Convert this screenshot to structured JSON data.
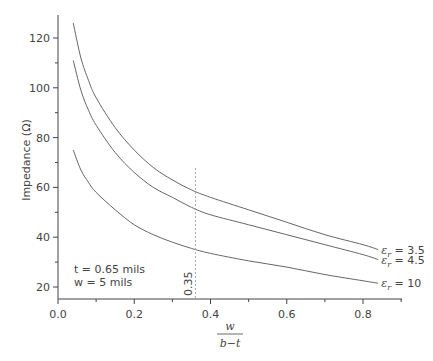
{
  "chart_data": {
    "type": "line",
    "title": "",
    "xlabel_numerator": "w",
    "xlabel_denominator": "b−t",
    "ylabel": "Impedance (Ω)",
    "xlim": [
      0.0,
      0.9
    ],
    "ylim": [
      15,
      130
    ],
    "x_ticks": [
      "0.0",
      "0.2",
      "0.4",
      "0.6",
      "0.8"
    ],
    "y_ticks": [
      "20",
      "40",
      "60",
      "80",
      "100",
      "120"
    ],
    "grid": false,
    "series": [
      {
        "name": "εr = 3.5",
        "label_prefix": "ε",
        "label_sub": "r",
        "label_value": " = 3.5",
        "x": [
          0.04,
          0.06,
          0.08,
          0.1,
          0.15,
          0.2,
          0.25,
          0.3,
          0.35,
          0.4,
          0.5,
          0.6,
          0.7,
          0.8,
          0.84
        ],
        "y": [
          126,
          112,
          103,
          96,
          84,
          75,
          68,
          63,
          59,
          56,
          51,
          46,
          41,
          37,
          35
        ]
      },
      {
        "name": "εr = 4.5",
        "label_prefix": "ε",
        "label_sub": "r",
        "label_value": " = 4.5",
        "x": [
          0.04,
          0.06,
          0.08,
          0.1,
          0.15,
          0.2,
          0.25,
          0.3,
          0.35,
          0.4,
          0.5,
          0.6,
          0.7,
          0.8,
          0.84
        ],
        "y": [
          111,
          99,
          91,
          85,
          74,
          66,
          60,
          56,
          52,
          49,
          45,
          41,
          37,
          33,
          31
        ]
      },
      {
        "name": "εr = 10",
        "label_prefix": "ε",
        "label_sub": "r",
        "label_value": " = 10",
        "x": [
          0.04,
          0.06,
          0.08,
          0.1,
          0.15,
          0.2,
          0.25,
          0.3,
          0.35,
          0.4,
          0.5,
          0.6,
          0.7,
          0.8,
          0.84
        ],
        "y": [
          75,
          67,
          62,
          58,
          51,
          45,
          41,
          38,
          35.5,
          33.5,
          30.5,
          28,
          25,
          22.5,
          21.5
        ]
      }
    ],
    "annotations": [
      {
        "text": "t = 0.65 mils",
        "position": "lower-left"
      },
      {
        "text": "w = 5 mils",
        "position": "lower-left"
      },
      {
        "text": "0.35",
        "type": "vertical-dashed-line",
        "x": 0.35
      }
    ],
    "line_color": "#666666"
  }
}
